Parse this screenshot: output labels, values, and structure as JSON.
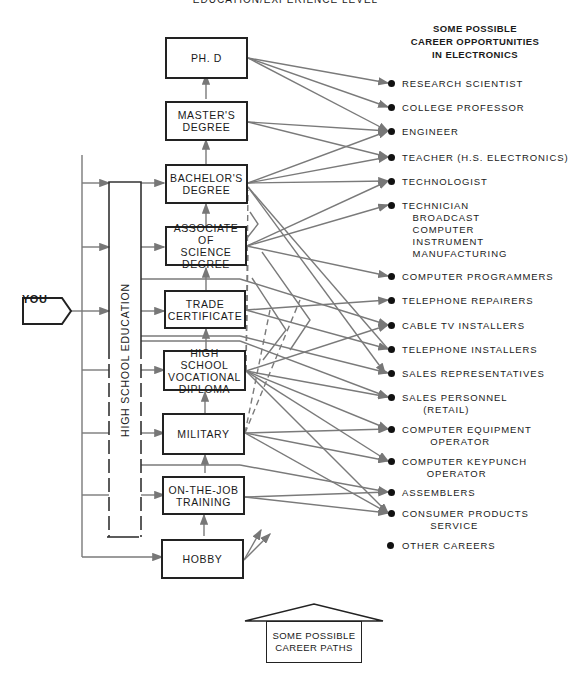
{
  "header": {
    "title": "EDUCATION/EXPERIENCE LEVEL",
    "opportunities_title": "SOME POSSIBLE\nCAREER OPPORTUNITIES\nIN ELECTRONICS"
  },
  "start_node": {
    "label": "YOU"
  },
  "high_school": {
    "label": "HIGH SCHOOL EDUCATION"
  },
  "levels": [
    {
      "id": "phd",
      "label": "PH. D"
    },
    {
      "id": "masters",
      "label": "MASTER'S\nDEGREE"
    },
    {
      "id": "bachelors",
      "label": "BACHELOR'S\nDEGREE"
    },
    {
      "id": "associate",
      "label": "ASSOCIATE OF\nSCIENCE\nDEGREE"
    },
    {
      "id": "trade",
      "label": "TRADE\nCERTIFICATE"
    },
    {
      "id": "vocational",
      "label": "HIGH SCHOOL\nVOCATIONAL\nDIPLOMA"
    },
    {
      "id": "military",
      "label": "MILITARY"
    },
    {
      "id": "ojt",
      "label": "ON-THE-JOB\nTRAINING"
    },
    {
      "id": "hobby",
      "label": "HOBBY"
    }
  ],
  "careers": [
    {
      "label": "RESEARCH SCIENTIST"
    },
    {
      "label": "COLLEGE PROFESSOR"
    },
    {
      "label": "ENGINEER"
    },
    {
      "label": "TEACHER (H.S. ELECTRONICS)"
    },
    {
      "label": "TECHNOLOGIST"
    },
    {
      "label": "TECHNICIAN\n   BROADCAST\n   COMPUTER\n   INSTRUMENT\n   MANUFACTURING"
    },
    {
      "label": "COMPUTER PROGRAMMERS"
    },
    {
      "label": "TELEPHONE REPAIRERS"
    },
    {
      "label": "CABLE TV INSTALLERS"
    },
    {
      "label": "TELEPHONE INSTALLERS"
    },
    {
      "label": "SALES REPRESENTATIVES"
    },
    {
      "label": "SALES PERSONNEL\n      (RETAIL)"
    },
    {
      "label": "COMPUTER EQUIPMENT\n        OPERATOR"
    },
    {
      "label": "COMPUTER KEYPUNCH\n       OPERATOR"
    },
    {
      "label": "ASSEMBLERS"
    },
    {
      "label": "CONSUMER PRODUCTS\n        SERVICE"
    },
    {
      "label": "OTHER CAREERS"
    }
  ],
  "legend": {
    "label": "SOME POSSIBLE\nCAREER PATHS"
  },
  "colors": {
    "line": "#7a7a7a",
    "border": "#222222",
    "dot": "#111111"
  }
}
